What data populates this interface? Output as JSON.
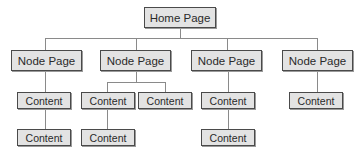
{
  "diagram": {
    "type": "site-map-tree",
    "root": {
      "label": "Home Page"
    },
    "nodes": [
      {
        "label": "Node Page",
        "children": [
          {
            "label": "Content",
            "children": [
              {
                "label": "Content"
              }
            ]
          }
        ]
      },
      {
        "label": "Node Page",
        "children": [
          {
            "label": "Content",
            "children": [
              {
                "label": "Content"
              }
            ]
          },
          {
            "label": "Content"
          }
        ]
      },
      {
        "label": "Node Page",
        "children": [
          {
            "label": "Content",
            "children": [
              {
                "label": "Content"
              }
            ]
          }
        ]
      },
      {
        "label": "Node Page",
        "children": [
          {
            "label": "Content"
          }
        ]
      }
    ]
  },
  "colors": {
    "box_fill": "#e3e3e3",
    "box_border": "#4a4a4a",
    "connector": "#8a8a8a",
    "text": "#2a2a2a"
  }
}
